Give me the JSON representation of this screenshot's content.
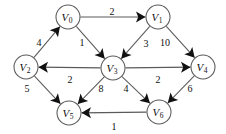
{
  "figure": {
    "kind": "directed-weighted-graph",
    "background_color": "#ffffff",
    "node_fill_color": "#ffffff",
    "edge_color": "#5a5a5a",
    "arrow_color": "#111111",
    "text_color": "#101010"
  },
  "nodes": [
    {
      "id": "V0",
      "name": "V",
      "sub": "0",
      "x": 68,
      "y": 17,
      "r": 12
    },
    {
      "id": "V1",
      "name": "V",
      "sub": "1",
      "x": 158,
      "y": 17,
      "r": 12
    },
    {
      "id": "V2",
      "name": "V",
      "sub": "2",
      "x": 26,
      "y": 67,
      "r": 12
    },
    {
      "id": "V3",
      "name": "V",
      "sub": "3",
      "x": 113,
      "y": 68,
      "r": 12
    },
    {
      "id": "V4",
      "name": "V",
      "sub": "4",
      "x": 203,
      "y": 67,
      "r": 12
    },
    {
      "id": "V5",
      "name": "V",
      "sub": "5",
      "x": 69,
      "y": 113,
      "r": 12
    },
    {
      "id": "V6",
      "name": "V",
      "sub": "6",
      "x": 159,
      "y": 112,
      "r": 12
    }
  ],
  "edges": [
    {
      "id": "e-v0-v1",
      "from": "V0",
      "to": "V1",
      "weight": "2",
      "label_x": 112,
      "label_y": 11
    },
    {
      "id": "e-v2-v0",
      "from": "V2",
      "to": "V0",
      "weight": "4",
      "label_x": 39,
      "label_y": 42
    },
    {
      "id": "e-v0-v3",
      "from": "V0",
      "to": "V3",
      "weight": "1",
      "label_x": 82,
      "label_y": 42
    },
    {
      "id": "e-v1-v3",
      "from": "V1",
      "to": "V3",
      "weight": "3",
      "label_x": 146,
      "label_y": 43
    },
    {
      "id": "e-v1-v4",
      "from": "V1",
      "to": "V4",
      "weight": "10",
      "label_x": 165,
      "label_y": 42
    },
    {
      "id": "e-v3-v2",
      "from": "V3",
      "to": "V2",
      "weight": "2",
      "label_x": 70,
      "label_y": 79
    },
    {
      "id": "e-v3-v4",
      "from": "V3",
      "to": "V4",
      "weight": "2",
      "label_x": 158,
      "label_y": 79
    },
    {
      "id": "e-v2-v5",
      "from": "V2",
      "to": "V5",
      "weight": "5",
      "label_x": 27,
      "label_y": 88
    },
    {
      "id": "e-v3-v5",
      "from": "V3",
      "to": "V5",
      "weight": "8",
      "label_x": 101,
      "label_y": 88
    },
    {
      "id": "e-v3-v6",
      "from": "V3",
      "to": "V6",
      "weight": "4",
      "label_x": 126,
      "label_y": 88
    },
    {
      "id": "e-v4-v6",
      "from": "V4",
      "to": "V6",
      "weight": "6",
      "label_x": 190,
      "label_y": 88
    },
    {
      "id": "e-v6-v5",
      "from": "V6",
      "to": "V5",
      "weight": "1",
      "label_x": 114,
      "label_y": 126
    }
  ]
}
